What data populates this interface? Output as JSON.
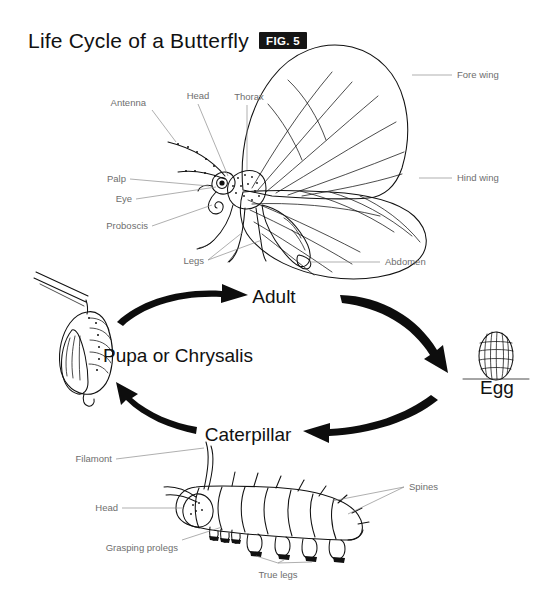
{
  "figure": {
    "title": "Life Cycle of a Butterfly",
    "badge": "FIG. 5",
    "background_color": "#ffffff",
    "ink_color": "#111111",
    "label_color": "#6e6e6e"
  },
  "stages": [
    {
      "id": "adult",
      "label": "Adult"
    },
    {
      "id": "egg",
      "label": "Egg"
    },
    {
      "id": "caterpillar",
      "label": "Caterpillar"
    },
    {
      "id": "pupa",
      "label": "Pupa or Chrysalis"
    }
  ],
  "cycle_arrows": [
    {
      "id": "pupa-to-adult",
      "from": "Pupa or Chrysalis",
      "to": "Adult",
      "direction": "up-right"
    },
    {
      "id": "adult-to-egg",
      "from": "Adult",
      "to": "Egg",
      "direction": "down-right"
    },
    {
      "id": "egg-to-caterpillar",
      "from": "Egg",
      "to": "Caterpillar",
      "direction": "down-left"
    },
    {
      "id": "caterpillar-to-pupa",
      "from": "Caterpillar",
      "to": "Pupa or Chrysalis",
      "direction": "up-left"
    }
  ],
  "butterfly_labels": [
    {
      "id": "antenna",
      "label": "Antenna"
    },
    {
      "id": "head",
      "label": "Head"
    },
    {
      "id": "thorax",
      "label": "Thorax"
    },
    {
      "id": "fore-wing",
      "label": "Fore wing"
    },
    {
      "id": "hind-wing",
      "label": "Hind wing"
    },
    {
      "id": "palp",
      "label": "Palp"
    },
    {
      "id": "eye",
      "label": "Eye"
    },
    {
      "id": "proboscis",
      "label": "Proboscis"
    },
    {
      "id": "legs",
      "label": "Legs"
    },
    {
      "id": "abdomen",
      "label": "Abdomen"
    }
  ],
  "caterpillar_labels": [
    {
      "id": "filament",
      "label": "Filamont"
    },
    {
      "id": "cat-head",
      "label": "Head"
    },
    {
      "id": "grasping-prolegs",
      "label": "Grasping prolegs"
    },
    {
      "id": "true-legs",
      "label": "True legs"
    },
    {
      "id": "spines",
      "label": "Spines"
    }
  ]
}
